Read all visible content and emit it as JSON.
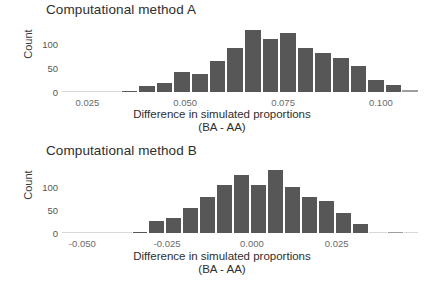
{
  "figure": {
    "background": "#ffffff",
    "bar_color": "#575757",
    "outlier_bar_color": "#9d9d9d"
  },
  "panels": [
    {
      "key": "method_a",
      "title": "Computational method A",
      "ylabel": "Count",
      "xlabel_line1": "Difference in simulated proportions",
      "xlabel_line2": "(BA - AA)",
      "yticks": [
        "0",
        "50",
        "100"
      ],
      "xticks": [
        "0.025",
        "0.050",
        "0.075",
        "0.100"
      ]
    },
    {
      "key": "method_b",
      "title": "Computational method B",
      "ylabel": "Count",
      "xlabel_line1": "Difference in simulated proportions",
      "xlabel_line2": "(BA - AA)",
      "yticks": [
        "0",
        "50",
        "100"
      ],
      "xticks": [
        "-0.050",
        "-0.025",
        "0.000",
        "0.025"
      ]
    }
  ],
  "chart_data": [
    {
      "type": "bar",
      "subtype": "histogram",
      "title": "Computational method A",
      "xlabel": "Difference in simulated proportions (BA - AA)",
      "ylabel": "Count",
      "grid": false,
      "legend": false,
      "xlim": [
        0.0185,
        0.1095
      ],
      "ylim": [
        0,
        138
      ],
      "xticks": [
        0.025,
        0.05,
        0.075,
        0.1
      ],
      "xtick_labels": [
        "0.025",
        "0.050",
        "0.075",
        "0.100"
      ],
      "yticks": [
        0,
        50,
        100
      ],
      "ytick_labels": [
        "0",
        "50",
        "100"
      ],
      "bin_width": 0.0045,
      "bin_starts": [
        0.0335,
        0.038,
        0.0425,
        0.047,
        0.0515,
        0.056,
        0.0605,
        0.065,
        0.0695,
        0.074,
        0.0785,
        0.083,
        0.0875,
        0.092,
        0.0965,
        0.101
      ],
      "bin_centers": [
        0.03575,
        0.04025,
        0.04475,
        0.04925,
        0.05375,
        0.05825,
        0.06275,
        0.06725,
        0.07175,
        0.07625,
        0.08075,
        0.08525,
        0.08975,
        0.09425,
        0.09875,
        0.10325
      ],
      "values": [
        2,
        13,
        19,
        42,
        37,
        65,
        91,
        129,
        111,
        123,
        93,
        82,
        72,
        55,
        25,
        14
      ],
      "trailing_outlier": {
        "bin_center": 0.1075,
        "value": 5
      }
    },
    {
      "type": "bar",
      "subtype": "histogram",
      "title": "Computational method B",
      "xlabel": "Difference in simulated proportions (BA - AA)",
      "ylabel": "Count",
      "grid": false,
      "legend": false,
      "xlim": [
        -0.056,
        0.049
      ],
      "ylim": [
        0,
        142
      ],
      "xticks": [
        -0.05,
        -0.025,
        0.0,
        0.025
      ],
      "xtick_labels": [
        "-0.050",
        "-0.025",
        "0.000",
        "0.025"
      ],
      "yticks": [
        0,
        50,
        100
      ],
      "ytick_labels": [
        "0",
        "50",
        "100"
      ],
      "bin_width": 0.005,
      "bin_starts": [
        -0.0355,
        -0.0305,
        -0.0255,
        -0.0205,
        -0.0155,
        -0.0105,
        -0.0055,
        -0.0005,
        0.0045,
        0.0095,
        0.0145,
        0.0195,
        0.0245,
        0.0295
      ],
      "bin_centers": [
        -0.033,
        -0.028,
        -0.023,
        -0.018,
        -0.013,
        -0.008,
        -0.003,
        0.002,
        0.007,
        0.012,
        0.017,
        0.022,
        0.027,
        0.032
      ],
      "values": [
        2,
        26,
        33,
        54,
        77,
        104,
        124,
        104,
        135,
        98,
        77,
        68,
        42,
        20
      ],
      "trailing_outlier": {
        "bin_center": 0.0425,
        "value": 3
      }
    }
  ]
}
